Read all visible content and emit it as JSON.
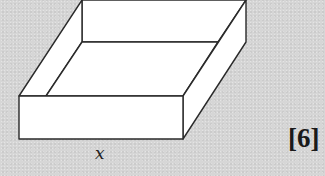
{
  "diagram": {
    "type": "open box (cuboid without lid)",
    "colors": {
      "background": "#d6d6d6",
      "face": "#ffffff",
      "stroke": "#2a2a2a"
    },
    "labels": {
      "base_edge": "x",
      "marks": "[6]"
    }
  }
}
